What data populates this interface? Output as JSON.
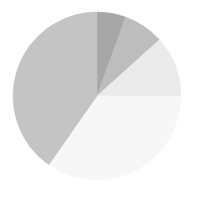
{
  "chart_data": {
    "type": "pie",
    "title": "",
    "subtitle": "",
    "xlabel": "",
    "ylabel": "",
    "grid": false,
    "legend": "none",
    "background_color": "#ffffff",
    "start_angle_deg": 0,
    "direction": "clockwise",
    "center": {
      "x": 97,
      "y": 96
    },
    "radius": 84,
    "total": 100,
    "categories": [
      "Slice 1",
      "Slice 2",
      "Slice 3",
      "Slice 4",
      "Slice 5"
    ],
    "values": [
      5.6,
      7.8,
      11.7,
      34.7,
      40.3
    ],
    "angles_deg": [
      20,
      28,
      42,
      125,
      145
    ],
    "colors": [
      "#a7a7a7",
      "#bdbdbd",
      "#ebebeb",
      "#f7f7f7",
      "#c4c4c4"
    ],
    "slices": [
      {
        "label": "Slice 1",
        "value": 5.6,
        "angle_deg": 20,
        "start_deg": 0,
        "end_deg": 20,
        "color": "#a7a7a7"
      },
      {
        "label": "Slice 2",
        "value": 7.8,
        "angle_deg": 28,
        "start_deg": 20,
        "end_deg": 48,
        "color": "#bdbdbd"
      },
      {
        "label": "Slice 3",
        "value": 11.7,
        "angle_deg": 42,
        "start_deg": 48,
        "end_deg": 90,
        "color": "#ebebeb"
      },
      {
        "label": "Slice 4",
        "value": 34.7,
        "angle_deg": 125,
        "start_deg": 90,
        "end_deg": 215,
        "color": "#f7f7f7"
      },
      {
        "label": "Slice 5",
        "value": 40.3,
        "angle_deg": 145,
        "start_deg": 215,
        "end_deg": 360,
        "color": "#c4c4c4"
      }
    ]
  }
}
